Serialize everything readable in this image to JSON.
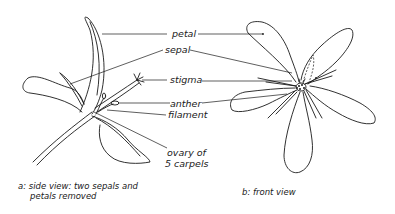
{
  "labels": {
    "petal": "petal",
    "sepal": "sepal",
    "stigma": "stigma",
    "anther": "anther",
    "filament": "filament",
    "ovary_line1": "ovary of",
    "ovary_line2": "5 carpels"
  },
  "captions": {
    "side_view_line1": "a: side view: two sepals and",
    "side_view_line2": "petals removed",
    "front_view": "b: front view"
  },
  "colors": {
    "ink": "#1a1a1a",
    "background": "#ffffff"
  }
}
